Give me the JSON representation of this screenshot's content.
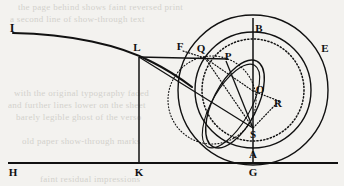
{
  "figure": {
    "background_color": "#f3f2ef",
    "ink_color": "#111111",
    "width": 344,
    "height": 186,
    "points": [
      {
        "id": "I",
        "label": "I",
        "x": 13,
        "y": 33,
        "label_x": 12,
        "label_y": 32
      },
      {
        "id": "L",
        "label": "L",
        "x": 139,
        "y": 57,
        "label_x": 135,
        "label_y": 50
      },
      {
        "id": "F",
        "label": "F",
        "x": 183,
        "y": 51,
        "label_x": 178,
        "label_y": 48
      },
      {
        "id": "Q",
        "label": "Q",
        "x": 204,
        "y": 57,
        "label_x": 199,
        "label_y": 51
      },
      {
        "id": "P",
        "label": "P",
        "x": 226,
        "y": 63,
        "label_x": 224,
        "label_y": 58
      },
      {
        "id": "B",
        "label": "B",
        "x": 253,
        "y": 32,
        "label_x": 255,
        "label_y": 30
      },
      {
        "id": "E",
        "label": "E",
        "x": 329,
        "y": 52,
        "label_x": 322,
        "label_y": 50
      },
      {
        "id": "O",
        "label": "O",
        "x": 253,
        "y": 91,
        "label_x": 256,
        "label_y": 90
      },
      {
        "id": "R",
        "label": "R",
        "x": 276,
        "y": 103,
        "label_x": 274,
        "label_y": 102
      },
      {
        "id": "S",
        "label": "S",
        "x": 253,
        "y": 128,
        "label_x": 249,
        "label_y": 135
      },
      {
        "id": "A",
        "label": "A",
        "x": 253,
        "y": 147,
        "label_x": 250,
        "label_y": 156
      },
      {
        "id": "H",
        "label": "H",
        "x": 13,
        "y": 163,
        "label_x": 10,
        "label_y": 174
      },
      {
        "id": "K",
        "label": "K",
        "x": 139,
        "y": 163,
        "label_x": 135,
        "label_y": 174
      },
      {
        "id": "G",
        "label": "G",
        "x": 253,
        "y": 163,
        "label_x": 249,
        "label_y": 174
      }
    ],
    "circles": [
      {
        "name": "outer-circle",
        "cx": 253,
        "cy": 90,
        "r": 75,
        "style": "solid"
      },
      {
        "name": "middle-circle",
        "cx": 253,
        "cy": 90,
        "r": 58,
        "style": "solid"
      },
      {
        "name": "inner-dotted-circle",
        "cx": 253,
        "cy": 90,
        "r": 51,
        "style": "dotted"
      },
      {
        "name": "small-dotted-circle",
        "cx": 212,
        "cy": 100,
        "r": 44,
        "style": "dotted"
      }
    ],
    "lines": [
      {
        "name": "baseline-HG",
        "from": "H",
        "to": "G",
        "style": "solid"
      },
      {
        "name": "vertical-KL",
        "from": "K",
        "to": "L",
        "style": "solid"
      },
      {
        "name": "vertical-GB",
        "from": "G",
        "to": "B",
        "style": "solid"
      },
      {
        "name": "horizontal-LQ",
        "from": "L",
        "to": "P",
        "style": "solid"
      },
      {
        "name": "chord-LS",
        "from": "L",
        "to": "S",
        "style": "solid"
      },
      {
        "name": "segment-SP",
        "from": "S",
        "to": "P",
        "style": "solid"
      },
      {
        "name": "segment-SQ-dotted",
        "from": "S",
        "to": "Q",
        "style": "dotted"
      },
      {
        "name": "segment-FQ-dotted",
        "from": "F",
        "to": "Q",
        "style": "dotted"
      },
      {
        "name": "segment-QO-dotted",
        "from": "Q",
        "to": "O",
        "style": "dotted"
      },
      {
        "name": "segment-OR-dotted",
        "from": "O",
        "to": "R",
        "style": "dotted"
      },
      {
        "name": "segment-RS-dotted",
        "from": "R",
        "to": "S",
        "style": "dotted"
      }
    ],
    "curves": [
      {
        "name": "curve-IL-trajectory",
        "style": "solid",
        "description": "descending curve from I through L"
      },
      {
        "name": "orbit-ellipse-PA",
        "style": "solid",
        "description": "elongated oval through P and A"
      }
    ],
    "bleed_through_text": [
      {
        "text": "the page behind shows faint reversed print",
        "x": 18,
        "y": 6
      },
      {
        "text": "a second line of show-through text",
        "x": 10,
        "y": 18
      },
      {
        "text": "with the original typography faded",
        "x": 14,
        "y": 92
      },
      {
        "text": "and further lines lower on the sheet",
        "x": 8,
        "y": 104
      },
      {
        "text": "barely legible ghost of the verso",
        "x": 16,
        "y": 116
      },
      {
        "text": "old paper show-through marks",
        "x": 22,
        "y": 140
      },
      {
        "text": "faint residual impressions",
        "x": 40,
        "y": 178
      }
    ]
  }
}
